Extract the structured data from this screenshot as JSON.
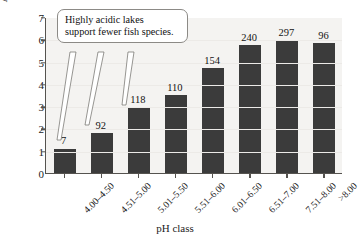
{
  "chart_data": {
    "type": "bar",
    "title": "",
    "xlabel": "pH class",
    "ylabel": "Average number of fish species",
    "categories": [
      "4.00–4.50",
      "4.51–5.00",
      "5.01–5.50",
      "5.51–6.00",
      "6.01–6.50",
      "6.51–7.00",
      "7.51–8.00",
      ">8.00"
    ],
    "values": [
      1.1,
      1.8,
      2.95,
      3.5,
      4.7,
      5.75,
      5.95,
      5.85
    ],
    "point_labels": [
      "7",
      "92",
      "118",
      "110",
      "154",
      "240",
      "297",
      "96"
    ],
    "ylim": [
      0,
      7
    ],
    "yticks": [
      "0",
      "1",
      "2",
      "3",
      "4",
      "5",
      "6",
      "7"
    ],
    "grid": false,
    "legend": "none",
    "bar_color": "#3b3b3b",
    "plot_background": "#f4f3f1",
    "axis_color": "#55534f",
    "annotations": [
      {
        "text_lines": [
          "Highly acidic lakes",
          "support fewer fish species."
        ],
        "points_to": [
          "4.00–4.50",
          "4.51–5.00",
          "5.01–5.50"
        ]
      }
    ]
  },
  "callout": {
    "line1": "Highly acidic lakes",
    "line2": "support fewer fish species."
  },
  "axes": {
    "y_title": "Average number of fish species",
    "x_title": "pH class"
  }
}
